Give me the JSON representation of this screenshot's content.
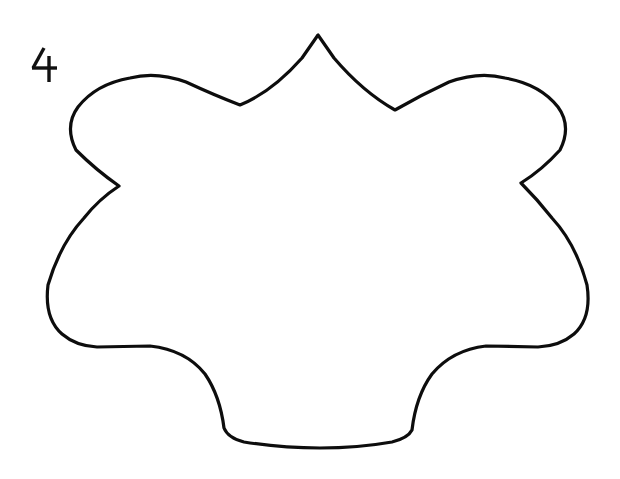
{
  "page": {
    "background_color": "#ffffff",
    "ink_color": "#0d0d0d",
    "width": 620,
    "height": 479,
    "kind": "line-art-template-worksheet"
  },
  "label": {
    "figure_number": "4",
    "icon_name": "handwritten-numeral-four",
    "position": {
      "x": 30,
      "y": 46
    },
    "color": "#111111"
  },
  "figure": {
    "name": "six-pointed-scalloped-star-outline",
    "stroke_width": 3.2,
    "fill": "#ffffff",
    "stroke": "#0d0d0d",
    "key_points": {
      "top_apex": {
        "x": 318,
        "y": 35
      },
      "left_valley": {
        "x": 240,
        "y": 105
      },
      "left_shoulder_peak": {
        "x": 130,
        "y": 78
      },
      "left_notch_cusp": {
        "x": 119,
        "y": 186
      },
      "left_extreme": {
        "x": 48,
        "y": 285
      },
      "bottom_left_lobe": {
        "x": 115,
        "y": 346
      },
      "bottom_left_cusp": {
        "x": 224,
        "y": 428
      },
      "bottom_center_dip": {
        "x": 320,
        "y": 448
      },
      "bottom_right_cusp": {
        "x": 412,
        "y": 430
      },
      "bottom_right_lobe": {
        "x": 520,
        "y": 346
      },
      "right_extreme": {
        "x": 587,
        "y": 285
      },
      "right_notch_cusp": {
        "x": 521,
        "y": 183
      },
      "right_shoulder_peak": {
        "x": 505,
        "y": 78
      },
      "right_valley": {
        "x": 395,
        "y": 110
      }
    },
    "outline_path": "M 318 35 L 302 58 Q 272 92 240 105 Q 214 95 186 82 Q 156 71 130 78 Q 96 84 78 107 Q 64 126 76 150 Q 96 170 119 186 Q 99 199 84 218 Q 60 244 48 285 Q 44 318 62 334 Q 76 346 97 347 L 150 346 Q 186 350 205 374 Q 220 396 224 428 Q 228 438 244 442 Q 282 448 320 448 Q 358 448 392 442 Q 408 438 412 430 Q 416 396 432 374 Q 452 350 486 346 L 538 347 Q 560 346 574 334 Q 592 318 587 285 Q 576 244 552 218 Q 537 199 521 183 Q 542 170 560 150 Q 572 126 558 107 Q 540 84 505 78 Q 479 71 449 82 Q 421 95 395 110 Q 363 92 334 58 Z",
    "numeral_strokes": {
      "diagonal": "M 14 2 L 3 22",
      "horizontal": "M 2 22 L 27 22",
      "vertical": "M 19 10 L 19 36"
    }
  }
}
